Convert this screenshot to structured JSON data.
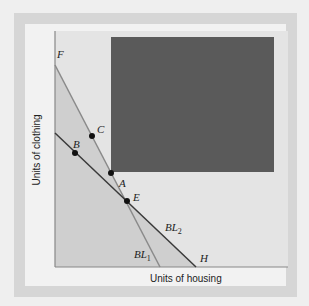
{
  "diagram": {
    "xlabel": "Units of housing",
    "ylabel": "Units of clothing",
    "points": [
      {
        "label": "A"
      },
      {
        "label": "B"
      },
      {
        "label": "C"
      },
      {
        "label": "E"
      }
    ],
    "endpoints": {
      "bl1_top": "F",
      "bl2_bottom": "H"
    },
    "lines": [
      {
        "name": "BL",
        "sub": "1"
      },
      {
        "name": "BL",
        "sub": "2"
      }
    ],
    "colors": {
      "frame": "#d6d6d6",
      "panel": "#f2f2f2",
      "plot_bg": "#e4e4e4",
      "budget_region": "#cfcfcf",
      "occluded_box": "#5a5a5a",
      "bl1": "#8a8a8a",
      "bl2": "#3a3a3a"
    }
  }
}
